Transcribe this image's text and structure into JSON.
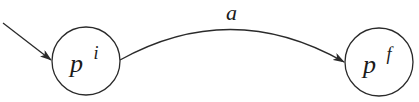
{
  "diagram": {
    "type": "state-transition",
    "states": [
      {
        "id": "initial",
        "base": "p",
        "superscript": "i",
        "is_initial": true
      },
      {
        "id": "final",
        "base": "p",
        "superscript": "f",
        "is_initial": false
      }
    ],
    "transitions": [
      {
        "from": "initial",
        "to": "final",
        "label": "a"
      }
    ],
    "colors": {
      "stroke": "#2a2a2a",
      "background": "#ffffff"
    }
  }
}
